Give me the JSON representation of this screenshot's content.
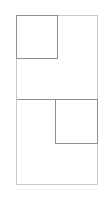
{
  "diagram": {
    "panels": [
      {
        "name": "top",
        "highlighted_quadrant": "top-left"
      },
      {
        "name": "bottom",
        "highlighted_quadrant": "top-right"
      }
    ],
    "colors": {
      "outer_border": "#c9c9c9",
      "inner_border": "#8f8f8f",
      "background": "#ffffff"
    }
  }
}
